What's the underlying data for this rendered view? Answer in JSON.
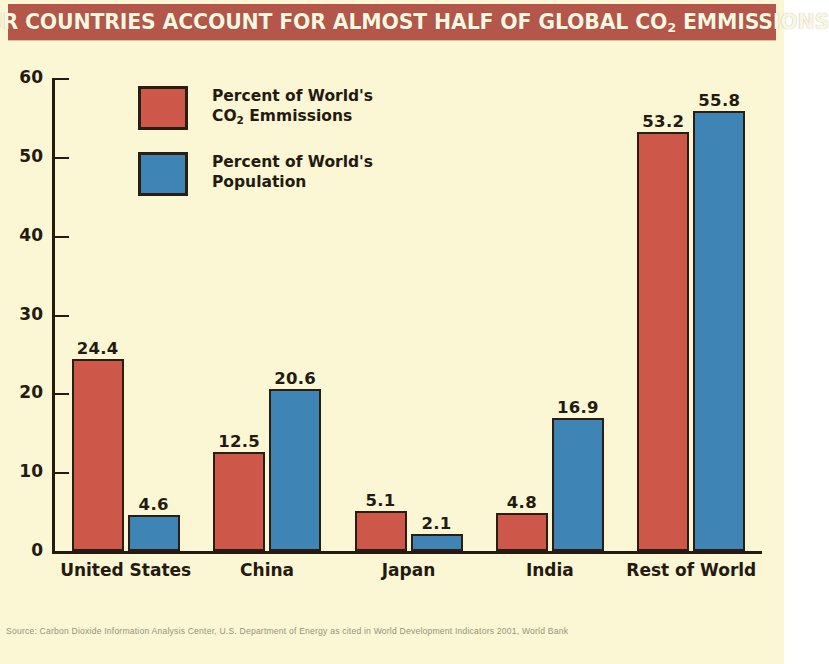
{
  "title": {
    "pre": "FOUR COUNTRIES ACCOUNT FOR ALMOST HALF OF GLOBAL CO",
    "sub": "2",
    "post": " EMMISSIONS",
    "full": "FOUR COUNTRIES ACCOUNT FOR ALMOST HALF OF GLOBAL CO2 EMMISSIONS"
  },
  "legend": {
    "items": [
      {
        "key": "co2",
        "line1": "Percent of World's",
        "line2_pre": "CO",
        "line2_sub": "2",
        "line2_post": " Emmissions",
        "color": "#CD584A"
      },
      {
        "key": "pop",
        "line1": "Percent of World's",
        "line2_pre": "Population",
        "line2_sub": "",
        "line2_post": "",
        "color": "#3E84B4"
      }
    ]
  },
  "axes": {
    "y_ticks": [
      "0",
      "10",
      "20",
      "30",
      "40",
      "50",
      "60"
    ],
    "y_min": 0,
    "y_max": 60,
    "x_categories": [
      "United States",
      "China",
      "Japan",
      "India",
      "Rest of World"
    ]
  },
  "source_note": "Source: Carbon Dioxide Information Analysis Center, U.S. Department of Energy as cited in World Development Indicators 2001, World Bank",
  "colors": {
    "background": "#FBF6D4",
    "banner": "#B4574A",
    "banner_text": "#FBF6E0",
    "co2": "#CD584A",
    "population": "#3E84B4",
    "ink": "#231A11"
  },
  "chart_data": {
    "type": "bar",
    "title": "FOUR COUNTRIES ACCOUNT FOR ALMOST HALF OF GLOBAL CO2 EMMISSIONS",
    "xlabel": "",
    "ylabel": "",
    "ylim": [
      0,
      60
    ],
    "yticks": [
      0,
      10,
      20,
      30,
      40,
      50,
      60
    ],
    "grid": false,
    "legend_position": "upper-left-inside",
    "categories": [
      "United States",
      "China",
      "Japan",
      "India",
      "Rest of World"
    ],
    "series": [
      {
        "name": "Percent of World's CO2 Emmissions",
        "color": "#CD584A",
        "values": [
          24.4,
          12.5,
          5.1,
          4.8,
          53.2
        ],
        "labels": [
          "24.4",
          "12.5",
          "5.1",
          "4.8",
          "53.2"
        ]
      },
      {
        "name": "Percent of World's Population",
        "color": "#3E84B4",
        "values": [
          4.6,
          20.6,
          2.1,
          16.9,
          55.8
        ],
        "labels": [
          "4.6",
          "20.6",
          "2.1",
          "16.9",
          "55.8"
        ]
      }
    ]
  }
}
